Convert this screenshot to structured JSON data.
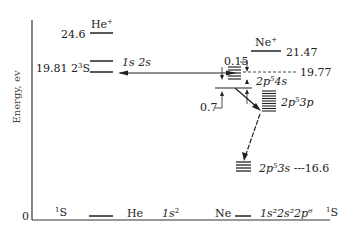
{
  "axis": {
    "ylabel": "Energy, ev",
    "zero_label": "0"
  },
  "helium": {
    "ion_label": "He",
    "ion_sup": "+",
    "ion_energy": "24.6",
    "metastable_energy": "19.81",
    "metastable_term_prefix": "2",
    "metastable_term_sup": "3",
    "metastable_term_suffix": "S",
    "metastable_config": "1s  2s",
    "ground_term_sup": "1",
    "ground_term": "S",
    "ground_atom": "He",
    "ground_config": "1s",
    "ground_config_sup": "2"
  },
  "neon": {
    "ion_label": "Ne",
    "ion_sup": "+",
    "ion_energy": "21.47",
    "level_4s_energy": "19.77",
    "gap_015": "0.15",
    "gap_07": "0.7",
    "level_4s_config_a": "2p",
    "level_4s_config_sup": "5",
    "level_4s_config_b": "4s",
    "level_3p_config_a": "2p",
    "level_3p_config_sup": "5",
    "level_3p_config_b": "3p",
    "level_3s_config_a": "2p",
    "level_3s_config_sup": "5",
    "level_3s_config_b": "3s",
    "level_3s_energy": "16.6",
    "ground_atom": "Ne",
    "ground_config": "1s²2s²2p⁶",
    "ground_term_sup": "1",
    "ground_term": "S"
  }
}
